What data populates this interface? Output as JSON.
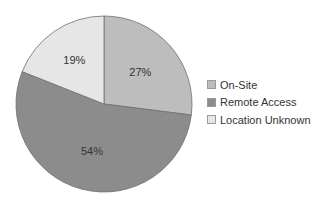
{
  "chart_data": {
    "type": "pie",
    "title": "",
    "categories": [
      "On-Site",
      "Remote Access",
      "Location Unknown"
    ],
    "values": [
      27,
      54,
      19
    ],
    "labels": [
      "27%",
      "54%",
      "19%"
    ],
    "colors": [
      "#bdbdbd",
      "#8c8c8c",
      "#e6e6e6"
    ],
    "start_angle": "12 o'clock",
    "direction": "clockwise",
    "legend_position": "right"
  },
  "legend": {
    "items": [
      {
        "label": "On-Site",
        "color": "#bdbdbd"
      },
      {
        "label": "Remote Access",
        "color": "#8c8c8c"
      },
      {
        "label": "Location Unknown",
        "color": "#e6e6e6"
      }
    ]
  }
}
